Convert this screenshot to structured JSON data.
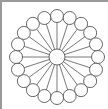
{
  "diagram": {
    "type": "radial-hub-and-spoke",
    "center": {
      "cx": 55,
      "cy": 55,
      "r": 8
    },
    "ring_radius": 41,
    "node_radius": 6.5,
    "node_count": 20,
    "stroke_color": "#555555",
    "fill_color": "#ffffff",
    "frame_color": "#9a9a9a"
  }
}
